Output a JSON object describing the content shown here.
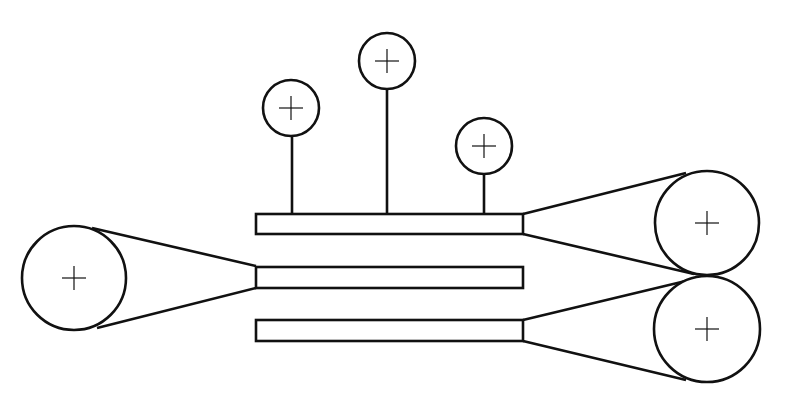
{
  "diagram": {
    "title": "",
    "colors": {
      "stroke": "#111111",
      "background": "#ffffff"
    },
    "guide_rollers": [
      {
        "id": "roller-1",
        "cx": 291,
        "cy": 108,
        "r": 28,
        "stem_x": 292,
        "symbol": "plus-icon"
      },
      {
        "id": "roller-2",
        "cx": 387,
        "cy": 61,
        "r": 28,
        "stem_x": 387,
        "symbol": "plus-icon"
      },
      {
        "id": "roller-3",
        "cx": 484,
        "cy": 146,
        "r": 28,
        "stem_x": 484,
        "symbol": "plus-icon"
      }
    ],
    "bars": [
      {
        "id": "bar-top",
        "x": 256,
        "y": 214,
        "width": 267,
        "height": 20
      },
      {
        "id": "bar-middle",
        "x": 256,
        "y": 267,
        "width": 267,
        "height": 21
      },
      {
        "id": "bar-bottom",
        "x": 256,
        "y": 320,
        "width": 267,
        "height": 21
      }
    ],
    "pulleys": [
      {
        "id": "pulley-left",
        "cx": 74,
        "cy": 278,
        "r": 52,
        "symbol": "plus-icon"
      },
      {
        "id": "pulley-right-top",
        "cx": 707,
        "cy": 223,
        "r": 52,
        "symbol": "plus-icon"
      },
      {
        "id": "pulley-right-bottom",
        "cx": 707,
        "cy": 329,
        "r": 53,
        "symbol": "plus-icon"
      }
    ],
    "belts": [
      {
        "from": "pulley-left",
        "to": "bar-middle",
        "lines": [
          [
            92,
            228,
            256,
            266
          ],
          [
            97,
            328,
            256,
            288
          ]
        ]
      },
      {
        "from": "bar-top",
        "to": "pulley-right-top",
        "lines": [
          [
            523,
            214,
            686,
            173
          ],
          [
            523,
            234,
            694,
            274
          ]
        ]
      },
      {
        "from": "bar-bottom",
        "to": "pulley-right-bottom",
        "lines": [
          [
            523,
            320,
            694,
            279
          ],
          [
            523,
            341,
            686,
            380
          ]
        ]
      }
    ]
  }
}
